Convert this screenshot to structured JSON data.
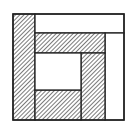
{
  "diagram": {
    "colors": {
      "stroke": "#222222",
      "hatch": "#333333",
      "fill_white": "#ffffff",
      "background": "#ffffff"
    },
    "regions": [
      {
        "name": "left-strip",
        "fill": "hatched",
        "x": 13,
        "y": 14,
        "w": 22,
        "h": 106
      },
      {
        "name": "top-strip",
        "fill": "white",
        "x": 35,
        "y": 14,
        "w": 89,
        "h": 19
      },
      {
        "name": "right-strip",
        "fill": "white",
        "x": 105,
        "y": 33,
        "w": 19,
        "h": 87
      },
      {
        "name": "inner-top-strip",
        "fill": "hatched",
        "x": 35,
        "y": 33,
        "w": 70,
        "h": 20
      },
      {
        "name": "inner-right-strip",
        "fill": "hatched",
        "x": 81,
        "y": 53,
        "w": 24,
        "h": 67
      },
      {
        "name": "inner-bottom-strip",
        "fill": "hatched",
        "x": 35,
        "y": 90,
        "w": 46,
        "h": 30
      },
      {
        "name": "center-square",
        "fill": "white",
        "x": 35,
        "y": 53,
        "w": 46,
        "h": 37
      }
    ]
  }
}
